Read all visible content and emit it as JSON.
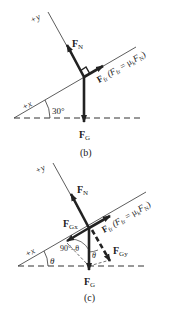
{
  "diagram_b": {
    "caption": "(b)",
    "axis_y_label": "+y",
    "axis_x_label": "+x",
    "angle_label": "30°",
    "normal_force": {
      "main": "F",
      "sub": "N"
    },
    "gravity_force": {
      "main": "F",
      "sub": "G"
    },
    "friction_force": {
      "main": "F",
      "sub": "fr"
    },
    "friction_relation": "(F",
    "friction_relation_sub": "fr",
    "friction_relation_eq": " = μ",
    "friction_relation_k": "k",
    "friction_relation_F": "F",
    "friction_relation_N": "N",
    "friction_relation_close": ")"
  },
  "diagram_c": {
    "caption": "(c)",
    "axis_y_label": "+y",
    "axis_x_label": "+x",
    "theta_label": "θ",
    "complement_label": "90°–θ",
    "normal_force": {
      "main": "F",
      "sub": "N"
    },
    "gravity_force": {
      "main": "F",
      "sub": "G"
    },
    "friction_force": {
      "main": "F",
      "sub": "fr"
    },
    "gravity_x": {
      "main": "F",
      "sub": "Gx"
    },
    "gravity_y": {
      "main": "F",
      "sub": "Gy"
    },
    "friction_relation": "(F",
    "friction_relation_sub": "fr",
    "friction_relation_eq": " = μ",
    "friction_relation_k": "k",
    "friction_relation_F": "F",
    "friction_relation_N": "N",
    "friction_relation_close": ")"
  },
  "colors": {
    "line": "#333333",
    "arrow": "#222222"
  }
}
